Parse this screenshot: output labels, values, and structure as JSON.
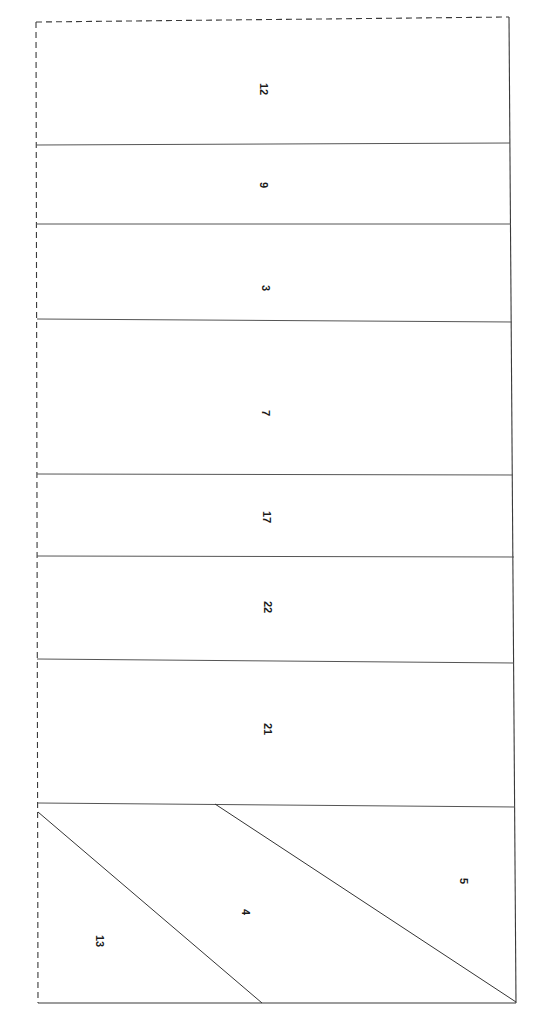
{
  "diagram": {
    "type": "cutting-layout",
    "line_color": "#3a3a3a",
    "dashed_edges": [
      "top",
      "left"
    ],
    "strips": [
      {
        "label": "12",
        "top_left_y": 22,
        "top_right_y": 17,
        "bottom_left_y": 145,
        "bottom_right_y": 143
      },
      {
        "label": "9",
        "top_left_y": 145,
        "top_right_y": 143,
        "bottom_left_y": 224,
        "bottom_right_y": 224
      },
      {
        "label": "3",
        "top_left_y": 224,
        "top_right_y": 224,
        "bottom_left_y": 319,
        "bottom_right_y": 322
      },
      {
        "label": "7",
        "top_left_y": 319,
        "top_right_y": 322,
        "bottom_left_y": 474,
        "bottom_right_y": 475
      },
      {
        "label": "17",
        "top_left_y": 474,
        "top_right_y": 475,
        "bottom_left_y": 556,
        "bottom_right_y": 557
      },
      {
        "label": "22",
        "top_left_y": 556,
        "top_right_y": 557,
        "bottom_left_y": 659,
        "bottom_right_y": 663
      },
      {
        "label": "21",
        "top_left_y": 659,
        "top_right_y": 663,
        "bottom_left_y": 803,
        "bottom_right_y": 807
      }
    ],
    "diagonal_pieces": [
      {
        "label": "13"
      },
      {
        "label": "4"
      },
      {
        "label": "5"
      }
    ],
    "labels": {
      "l12": "12",
      "l9": "9",
      "l3": "3",
      "l7": "7",
      "l17": "17",
      "l22": "22",
      "l21": "21",
      "l13": "13",
      "l4": "4",
      "l5": "5"
    },
    "label_rotation_deg": 90
  }
}
